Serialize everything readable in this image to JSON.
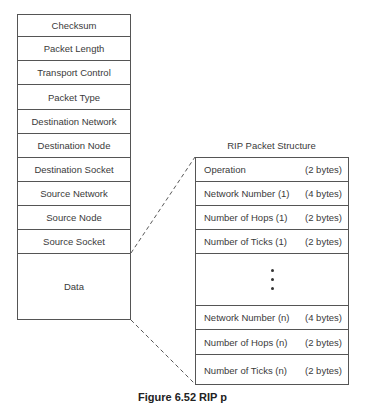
{
  "ipx_packet": {
    "fields": [
      "Checksum",
      "Packet Length",
      "Transport Control",
      "Packet Type",
      "Destination Network",
      "Destination Node",
      "Destination Socket",
      "Source Network",
      "Source Node",
      "Source Socket"
    ],
    "data_label": "Data"
  },
  "rip_packet": {
    "title": "RIP Packet Structure",
    "rows_top": [
      {
        "name": "Operation",
        "size": "(2 bytes)"
      },
      {
        "name": "Network Number (1)",
        "size": "(4 bytes)"
      },
      {
        "name": "Number of Hops (1)",
        "size": "(2 bytes)"
      },
      {
        "name": "Number of Ticks (1)",
        "size": "(2 bytes)"
      }
    ],
    "ellipsis": "⋮",
    "rows_bottom": [
      {
        "name": "Network Number (n)",
        "size": "(4 bytes)"
      },
      {
        "name": "Number of Hops (n)",
        "size": "(2 bytes)"
      },
      {
        "name": "Number of Ticks (n)",
        "size": "(2 bytes)"
      }
    ]
  },
  "caption": "Figure 6.52 RIP p"
}
